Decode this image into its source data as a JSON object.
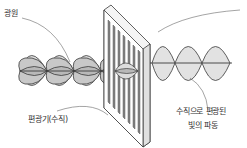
{
  "labels": {
    "light_source": "광원",
    "polarizer": "편광기(수직)",
    "polarized_line1": "수직으로 편광된",
    "polarized_line2": "빛의 파동"
  },
  "colors": {
    "stroke": "#3a3a3a",
    "fill": "#dcdcdc",
    "fill_dark": "#b8b8b8",
    "polarizer_face": "#ffffff",
    "slit": "#8a8a8a",
    "leader": "#666666"
  }
}
